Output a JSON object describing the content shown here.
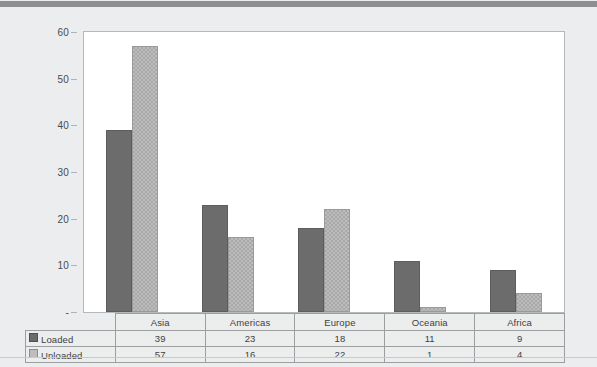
{
  "chart_data": {
    "type": "bar",
    "title": "",
    "subtitle": "",
    "xlabel": "",
    "ylabel": "",
    "categories": [
      "Asia",
      "Americas",
      "Europe",
      "Oceania",
      "Africa"
    ],
    "series": [
      {
        "name": "Loaded",
        "values": [
          39,
          23,
          18,
          11,
          9
        ],
        "color": "#6c6c6c"
      },
      {
        "name": "Unloaded",
        "values": [
          57,
          16,
          22,
          1,
          4
        ],
        "color": "#a9a9a9"
      }
    ],
    "ylim": [
      0,
      60
    ],
    "yticks": [
      0,
      10,
      20,
      30,
      40,
      50,
      60
    ],
    "ytick_labels": [
      "-",
      "10",
      "20",
      "30",
      "40",
      "50",
      "60"
    ],
    "grid": false,
    "legend_position": "data-table",
    "annotations": []
  },
  "data_table": {
    "header_row": [
      "",
      "Asia",
      "Americas",
      "Europe",
      "Oceania",
      "Africa"
    ],
    "rows": [
      {
        "label": "Loaded",
        "swatch": "dark-square-icon",
        "values": [
          "39",
          "23",
          "18",
          "11",
          "9"
        ]
      },
      {
        "label": "Unloaded",
        "swatch": "light-square-icon",
        "values": [
          "57",
          "16",
          "22",
          "1",
          "4"
        ]
      }
    ]
  },
  "colors": {
    "page_background": "#ecedee",
    "top_band": "#8d8f90",
    "plot_background": "#ffffff",
    "plot_border": "#b7b8b9",
    "table_border": "#9d9e9f",
    "loaded": "#6c6c6c",
    "unloaded": "#a9a9a9",
    "text": "#3f3f3f"
  }
}
